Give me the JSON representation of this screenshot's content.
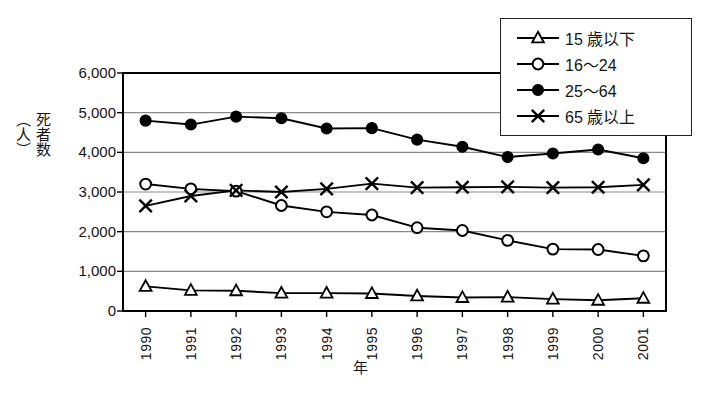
{
  "chart_data": {
    "type": "line",
    "title": "",
    "xlabel": "年",
    "ylabel": "死者数\n（人）",
    "ylabel_lines": [
      "死",
      "者",
      "数",
      "（人）"
    ],
    "categories": [
      "1990",
      "1991",
      "1992",
      "1993",
      "1994",
      "1995",
      "1996",
      "1997",
      "1998",
      "1999",
      "2000",
      "2001"
    ],
    "ylim": [
      0,
      6000
    ],
    "ytick_values": [
      0,
      1000,
      2000,
      3000,
      4000,
      5000,
      6000
    ],
    "ytick_labels": [
      "0",
      "1,000",
      "2,000",
      "3,000",
      "4,000",
      "5,000",
      "6,000"
    ],
    "grid": "horizontal",
    "legend_position": "top-right",
    "series": [
      {
        "name": "15 歳以下",
        "marker": "open-triangle",
        "values": [
          620,
          520,
          510,
          450,
          450,
          440,
          380,
          340,
          350,
          300,
          270,
          320
        ]
      },
      {
        "name": "16～24",
        "marker": "open-circle",
        "values": [
          3200,
          3080,
          3020,
          2660,
          2500,
          2420,
          2100,
          2030,
          1780,
          1560,
          1550,
          1390
        ]
      },
      {
        "name": "25～64",
        "marker": "filled-circle",
        "values": [
          4800,
          4700,
          4900,
          4860,
          4600,
          4610,
          4320,
          4140,
          3880,
          3970,
          4070,
          3850
        ]
      },
      {
        "name": "65 歳以上",
        "marker": "cross-x",
        "values": [
          2650,
          2900,
          3040,
          3000,
          3080,
          3210,
          3110,
          3120,
          3130,
          3110,
          3120,
          3180
        ]
      }
    ],
    "colors": {
      "line": "#000000",
      "grid": "#8a8a8a",
      "axis": "#000000",
      "text": "#141414",
      "background": "#ffffff"
    }
  }
}
